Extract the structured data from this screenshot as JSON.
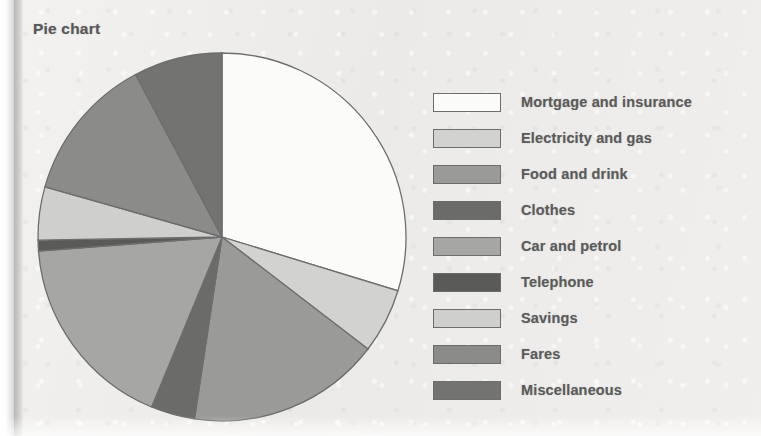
{
  "title": "Pie chart",
  "chart_data": {
    "type": "pie",
    "title": "Pie chart",
    "xlabel": "",
    "ylabel": "",
    "legend_position": "right",
    "grid": false,
    "start_angle_deg": 0,
    "direction": "clockwise",
    "categories": [
      "Mortgage and insurance",
      "Electricity and gas",
      "Food and drink",
      "Clothes",
      "Car and petrol",
      "Telephone",
      "Savings",
      "Fares",
      "Miscellaneous"
    ],
    "values": [
      29.7,
      5.7,
      17.0,
      3.9,
      17.5,
      0.9,
      4.7,
      12.8,
      7.8
    ],
    "angles_deg": [
      107.0,
      20.5,
      61.1,
      13.9,
      63.1,
      3.4,
      16.8,
      46.2,
      28.0
    ],
    "colors": [
      "#fbfbf9",
      "#d2d2d0",
      "#9a9a98",
      "#6b6b69",
      "#a6a6a4",
      "#5a5a58",
      "#cfcfcd",
      "#8b8b89",
      "#737371"
    ],
    "stroke_color": "#6d6d6d"
  },
  "legend": {
    "items": [
      {
        "label": "Mortgage and insurance",
        "color": "#fbfbf9"
      },
      {
        "label": "Electricity and gas",
        "color": "#d2d2d0"
      },
      {
        "label": "Food and drink",
        "color": "#9a9a98"
      },
      {
        "label": "Clothes",
        "color": "#6b6b69"
      },
      {
        "label": "Car and petrol",
        "color": "#a6a6a4"
      },
      {
        "label": "Telephone",
        "color": "#5a5a58"
      },
      {
        "label": "Savings",
        "color": "#cfcfcd"
      },
      {
        "label": "Fares",
        "color": "#8b8b89"
      },
      {
        "label": "Miscellaneous",
        "color": "#737371"
      }
    ]
  }
}
